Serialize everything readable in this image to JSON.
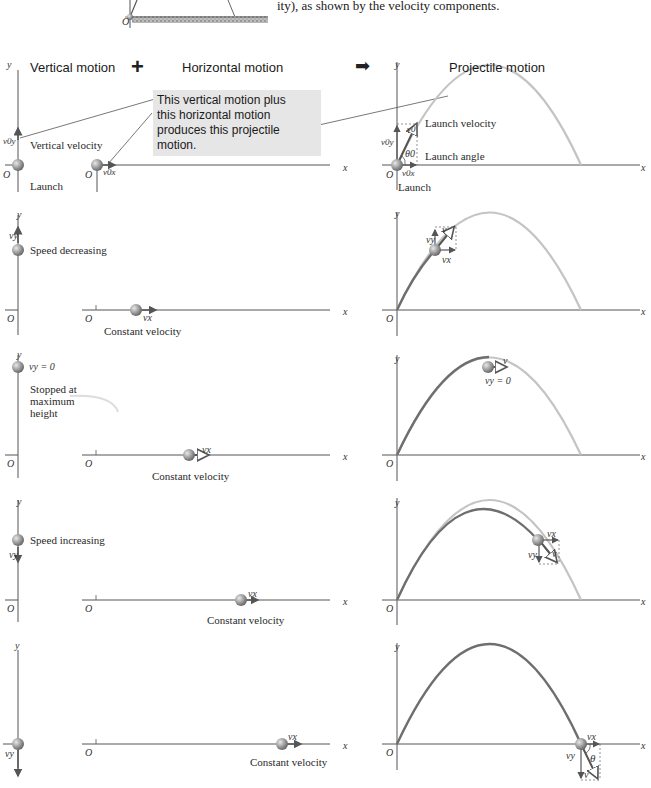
{
  "top_fragment": {
    "caption_tail": "ity), as shown by the velocity components.",
    "origin_label": "O"
  },
  "headers": {
    "vertical": "Vertical motion",
    "plus": "+",
    "horizontal": "Horizontal motion",
    "arrow": "➡",
    "projectile": "Projectile motion"
  },
  "callout": {
    "line1": "This vertical motion plus",
    "line2": "this horizontal motion",
    "line3": "produces this projectile motion."
  },
  "axes": {
    "x": "x",
    "y": "y",
    "origin": "O"
  },
  "rows": [
    {
      "vertical": {
        "label": "Vertical velocity",
        "sublabel": "Launch",
        "symbol": "v0y"
      },
      "horizontal": {
        "label": "",
        "symbol": "v0x"
      },
      "projectile": {
        "label1": "Launch velocity",
        "label2": "Launch angle",
        "label3": "Launch",
        "sym_v": "v0",
        "sym_vy": "v0y",
        "sym_vx": "v0x",
        "sym_theta": "θ0"
      }
    },
    {
      "vertical": {
        "label": "Speed decreasing",
        "symbol": "vy"
      },
      "horizontal": {
        "label": "Constant velocity",
        "symbol": "vx"
      },
      "projectile": {
        "sym_v": "v",
        "sym_vy": "vy",
        "sym_vx": "vx"
      }
    },
    {
      "vertical": {
        "label": "vy = 0",
        "label2": "Stopped at",
        "label3": "maximum",
        "label4": "height"
      },
      "horizontal": {
        "label": "Constant velocity",
        "symbol": "vx"
      },
      "projectile": {
        "sym_v": "v",
        "sym_vy0": "vy = 0"
      }
    },
    {
      "vertical": {
        "label": "Speed increasing",
        "symbol": "vy"
      },
      "horizontal": {
        "label": "Constant velocity",
        "symbol": "vx"
      },
      "projectile": {
        "sym_v": "v",
        "sym_vy": "vy",
        "sym_vx": "vx"
      }
    },
    {
      "vertical": {
        "symbol": "vy"
      },
      "horizontal": {
        "label": "Constant velocity",
        "symbol": "vx"
      },
      "projectile": {
        "sym_v": "v",
        "sym_vy": "vy",
        "sym_vx": "vx",
        "sym_theta": "θ"
      }
    }
  ],
  "colors": {
    "axis": "#4a4a4a",
    "trajectory_past": "#6e6e6e",
    "trajectory_future": "#c4c4c4",
    "ball": "#9a9a9a",
    "callout_bg": "#e6e6e6"
  }
}
